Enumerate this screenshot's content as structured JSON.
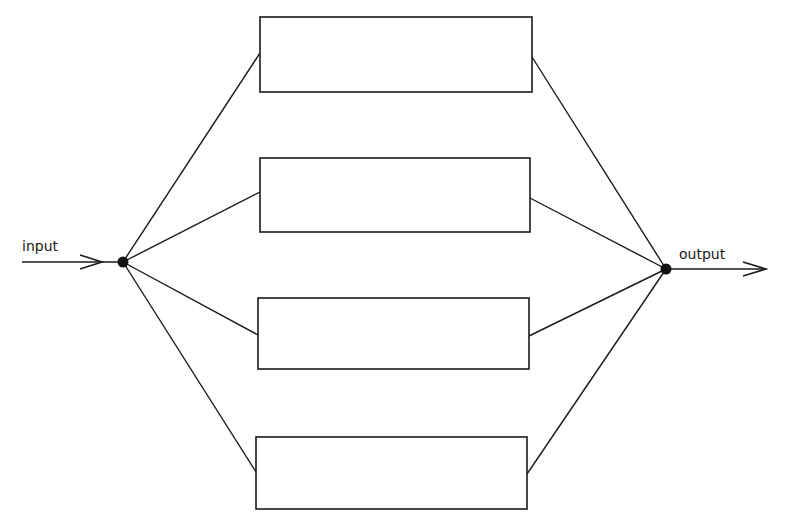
{
  "diagram": {
    "type": "parallel-system-block-diagram",
    "input_label": "input",
    "output_label": "output",
    "line_color": "#1a1a1a",
    "background": "#ffffff",
    "input_node": {
      "x": 123,
      "y": 262
    },
    "output_node": {
      "x": 666,
      "y": 269
    },
    "blocks": [
      {
        "id": "block-1",
        "label": "",
        "x": 260,
        "y": 17,
        "w": 272,
        "h": 75,
        "in_y": 53,
        "out_y": 57
      },
      {
        "id": "block-2",
        "label": "",
        "x": 260,
        "y": 158,
        "w": 270,
        "h": 74,
        "in_y": 192,
        "out_y": 198
      },
      {
        "id": "block-3",
        "label": "",
        "x": 258,
        "y": 298,
        "w": 271,
        "h": 71,
        "in_y": 335,
        "out_y": 336
      },
      {
        "id": "block-4",
        "label": "",
        "x": 256,
        "y": 437,
        "w": 271,
        "h": 72,
        "in_y": 472,
        "out_y": 474
      }
    ]
  }
}
